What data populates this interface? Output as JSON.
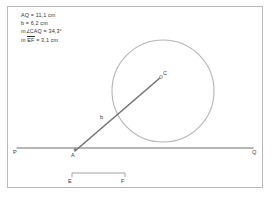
{
  "figure": {
    "type": "geometry-sketch",
    "background_color": "#ffffff",
    "border_color": "#b9b9b9",
    "line_color": "#9a9a9a",
    "ray_color": "#6d6d6d",
    "circle_color": "#b0b0b0",
    "text_color": "#2f2f2f"
  },
  "measurements": {
    "items": [
      {
        "id": "aq-length",
        "text": "AQ = 11,1 cm"
      },
      {
        "id": "b-length",
        "text": "b = 6,2 cm"
      },
      {
        "id": "angle-caq",
        "prefix": "m∠CAQ = ",
        "value": "34,3°",
        "text": "m∠CAQ = 34,3°"
      },
      {
        "id": "ef-length",
        "prefix": "m ",
        "overline": "EF",
        "suffix": " = 3,1 cm",
        "text": "m EF = 3,1 cm"
      }
    ]
  },
  "points": {
    "P": {
      "label": "P",
      "x": 17,
      "y": 148
    },
    "A": {
      "label": "A",
      "x": 75,
      "y": 148
    },
    "Q": {
      "label": "Q",
      "x": 253,
      "y": 148
    },
    "C": {
      "label": "C",
      "x": 160,
      "y": 77
    },
    "E": {
      "label": "E",
      "x": 72,
      "y": 173
    },
    "F": {
      "label": "F",
      "x": 125,
      "y": 173
    }
  },
  "labels": {
    "ray_segment": "b"
  },
  "shapes": {
    "line_PQ": {
      "name": "line-pq",
      "x1": 17,
      "y1": 148,
      "x2": 253,
      "y2": 148
    },
    "ray_AC": {
      "name": "ray-ac",
      "x1": 75,
      "y1": 151,
      "x2": 161,
      "y2": 77
    },
    "circle": {
      "name": "circle-c",
      "cx": 163,
      "cy": 91,
      "r": 51
    },
    "segment_EF": {
      "name": "segment-ef",
      "x1": 72,
      "y1": 173,
      "x2": 125,
      "y2": 173
    }
  }
}
